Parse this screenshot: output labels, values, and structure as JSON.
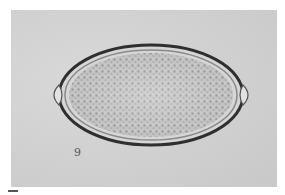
{
  "image": {
    "subject": "microscopy of barrel-shaped egg with bipolar plugs",
    "background_color": "#cfcfcf",
    "shell_color": "#3a3a3a",
    "content_color": "#bdbdbd",
    "annotation_glyph": "9"
  }
}
